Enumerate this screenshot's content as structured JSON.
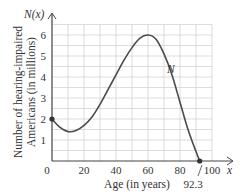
{
  "chart_data": {
    "type": "line",
    "title": "",
    "xlabel": "Age (in years)",
    "ylabel_line1": "Number of hearing-impaired",
    "ylabel_line2": "Americans (in millions)",
    "y_axis_name": "N(x)",
    "x_axis_name": "x",
    "curve_label": "N",
    "xlim": [
      0,
      100
    ],
    "ylim": [
      0,
      6.5
    ],
    "x_ticks": [
      "0",
      "20",
      "40",
      "60",
      "80",
      "100"
    ],
    "y_ticks": [
      "1",
      "2",
      "3",
      "4",
      "5",
      "6"
    ],
    "annotation_root": "92.3",
    "grid": true,
    "series": [
      {
        "name": "N",
        "x": [
          0,
          5,
          10,
          15,
          20,
          25,
          30,
          35,
          40,
          45,
          50,
          55,
          60,
          65,
          70,
          75,
          80,
          85,
          90,
          92.3
        ],
        "values": [
          2.0,
          1.6,
          1.4,
          1.45,
          1.7,
          2.1,
          2.7,
          3.4,
          4.1,
          4.8,
          5.4,
          5.85,
          6.0,
          5.8,
          5.1,
          4.1,
          2.8,
          1.5,
          0.45,
          0.0
        ]
      }
    ],
    "points": [
      {
        "x": 0,
        "y": 2.0
      },
      {
        "x": 92.3,
        "y": 0
      }
    ]
  }
}
